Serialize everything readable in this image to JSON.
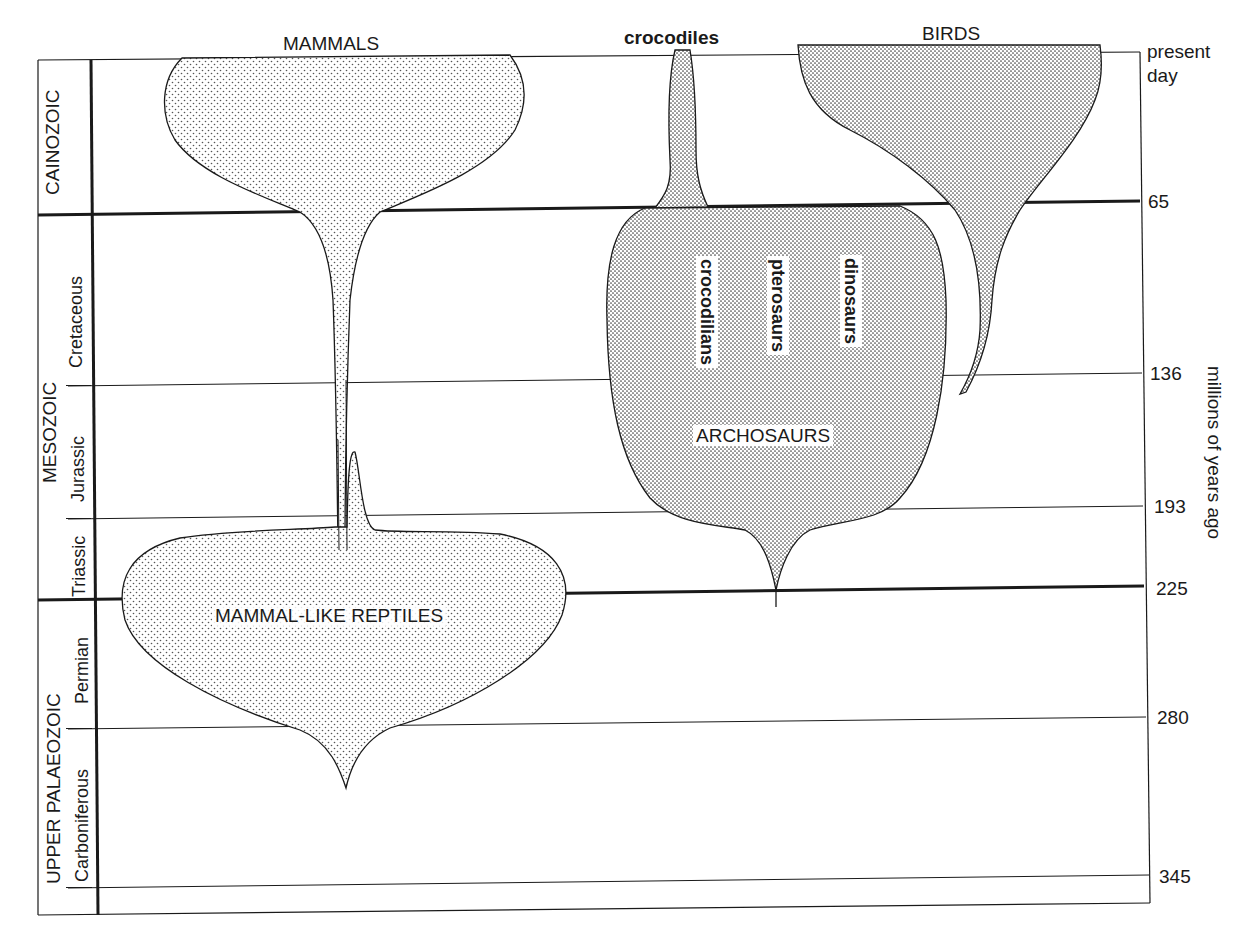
{
  "columns": {
    "mammals": "MAMMALS",
    "crocodiles": "crocodiles",
    "birds": "BIRDS"
  },
  "groups": {
    "mammal_like_reptiles": "MAMMAL-LIKE REPTILES",
    "archosaurs": "ARCHOSAURS",
    "archosaur_subgroups": [
      "crocodilians",
      "pterosaurs",
      "dinosaurs"
    ]
  },
  "eras": [
    {
      "name": "CAINOZOIC",
      "periods": []
    },
    {
      "name": "MESOZOIC",
      "periods": [
        "Cretaceous",
        "Jurassic",
        "Triassic"
      ]
    },
    {
      "name": "UPPER PALAEOZOIC",
      "periods": [
        "Permian",
        "Carboniferous"
      ]
    }
  ],
  "time_axis": {
    "top_label_line1": "present",
    "top_label_line2": "day",
    "ticks": [
      "65",
      "136",
      "193",
      "225",
      "280",
      "345"
    ],
    "axis_label": "millions of years ago"
  },
  "colors": {
    "ink": "#1a1a1a",
    "stipple": "#555555",
    "paper": "#ffffff"
  }
}
